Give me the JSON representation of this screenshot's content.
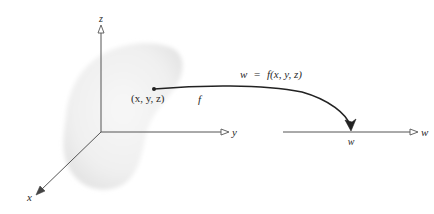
{
  "diagram": {
    "type": "function-mapping-3d-to-line",
    "domain_axes": {
      "x_label": "x",
      "y_label": "y",
      "z_label": "z"
    },
    "point_label": "(x, y, z)",
    "mapping_label": "f",
    "equation": {
      "lhs": "w",
      "equals": "=",
      "rhs": "f(x, y, z)"
    },
    "equation_text": "w = f(x, y, z)",
    "codomain": {
      "axis_label": "w",
      "point_label": "w"
    },
    "colors": {
      "line": "#444444",
      "curve": "#222222",
      "region": "#e8e8e8",
      "text": "#2a2a2a"
    }
  }
}
